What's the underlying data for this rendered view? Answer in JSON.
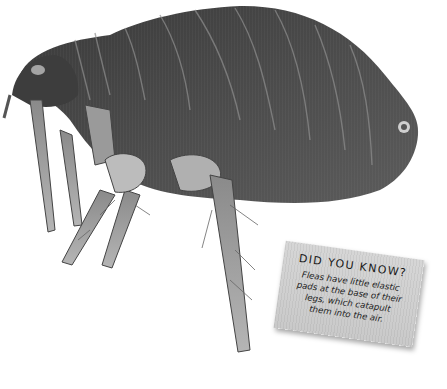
{
  "image": {
    "subject": "flea-photograph",
    "background_color": "#ffffff"
  },
  "fact_card": {
    "title": "DID YOU KNOW?",
    "body_lines": [
      "Fleas have little elastic",
      "pads at the base of their",
      "legs, which catapult",
      "them into the air."
    ],
    "card_color": "#d2d2d2",
    "text_color": "#1a1a1a"
  }
}
